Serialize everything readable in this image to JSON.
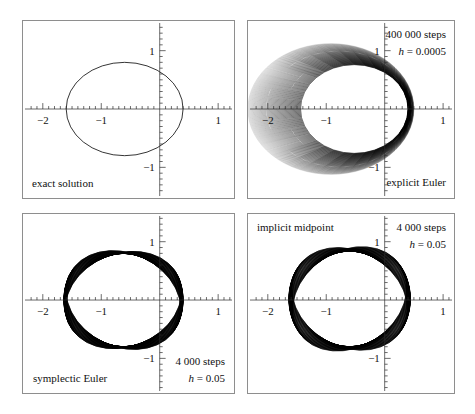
{
  "figure": {
    "background_color": "#ffffff",
    "frame_color": "#8e8e8e",
    "curve_color": "#000000"
  },
  "axes": {
    "x_label_values": [
      "-2",
      "-1",
      "1"
    ],
    "y_label_values": [
      "1",
      "-1"
    ],
    "x_range": [
      -2.45,
      1.45
    ],
    "y_range": [
      -1.52,
      1.52
    ],
    "x_major_ticks": [
      -2,
      -1,
      0,
      1
    ],
    "y_major_ticks": [
      -1,
      1
    ],
    "minor_tick_step": 0.1,
    "units_per_pixel": 0.016949,
    "pixels_per_unit": 59,
    "grid": false
  },
  "panels": [
    {
      "id": "exact",
      "method_label": "exact solution",
      "method_label_position": "bottom-left",
      "steps_label": "",
      "stepsize_label": "",
      "n_curves": 1,
      "description": "single exact Kepler ellipse, eccentricity 0.6"
    },
    {
      "id": "explicit",
      "method_label": "explicit Euler",
      "method_label_position": "bottom-right",
      "steps_label": "400 000 steps",
      "stepsize_label": "h = 0.0005",
      "stepsize_symbol": "h",
      "stepsize_value": "0.0005",
      "steps_count": "400 000",
      "n_curves": 60,
      "description": "outward spiralling family of ellipses, energy grows"
    },
    {
      "id": "symplectic",
      "method_label": "symplectic Euler",
      "method_label_position": "bottom-left",
      "steps_label": "4 000 steps",
      "stepsize_label": "h = 0.05",
      "stepsize_symbol": "h",
      "stepsize_value": "0.05",
      "steps_count": "4 000",
      "n_curves": 60,
      "description": "slowly precessing closed band, energy bounded"
    },
    {
      "id": "midpoint",
      "method_label": "implicit midpoint",
      "method_label_position": "top-left",
      "steps_label": "4 000 steps",
      "stepsize_label": "h = 0.05",
      "stepsize_symbol": "h",
      "stepsize_value": "0.05",
      "steps_count": "4 000",
      "n_curves": 60,
      "description": "precessing band of ellipses, energy bounded"
    }
  ],
  "chart_data": {
    "type": "line",
    "xlabel": "",
    "ylabel": "",
    "xlim": [
      -2.45,
      1.45
    ],
    "ylim": [
      -1.52,
      1.52
    ],
    "grid": false,
    "legend_position": "in-panel-annotations",
    "subplots": [
      {
        "panel": "exact",
        "annotations": [
          "exact solution"
        ],
        "series": [
          {
            "name": "exact ellipse",
            "shape": "ellipse",
            "center": [
              -0.6,
              0.0
            ],
            "semi_major": 1.0,
            "semi_minor": 0.8,
            "eccentricity": 0.6,
            "rotation_deg": 0,
            "stroke": "#000000",
            "stroke_width": 0.8
          }
        ]
      },
      {
        "panel": "explicit",
        "annotations": [
          "400 000 steps",
          "h = 0.0005",
          "explicit Euler"
        ],
        "series": [
          {
            "name": "explicit Euler family",
            "shape": "ellipse-family",
            "count": 60,
            "center_start": [
              -0.52,
              0.0
            ],
            "center_end": [
              -0.92,
              0.0
            ],
            "semi_major_start": 0.92,
            "semi_major_end": 1.42,
            "semi_minor_start": 0.76,
            "semi_minor_end": 1.12,
            "rotation_start_deg": 0,
            "rotation_end_deg": 0,
            "opacity_start": 1.0,
            "opacity_end": 0.22,
            "stroke": "#000000"
          }
        ]
      },
      {
        "panel": "symplectic",
        "annotations": [
          "4 000 steps",
          "h = 0.05",
          "symplectic Euler"
        ],
        "series": [
          {
            "name": "symplectic Euler family",
            "shape": "ellipse-family",
            "count": 60,
            "center_start": [
              -0.62,
              0.0
            ],
            "center_end": [
              -0.62,
              0.0
            ],
            "semi_major_start": 1.02,
            "semi_major_end": 1.02,
            "semi_minor_start": 0.8,
            "semi_minor_end": 0.8,
            "rotation_start_deg": -22,
            "rotation_end_deg": 26,
            "opacity_start": 0.95,
            "opacity_end": 0.95,
            "stroke": "#000000"
          }
        ]
      },
      {
        "panel": "midpoint",
        "annotations": [
          "implicit midpoint",
          "4 000 steps",
          "h = 0.05"
        ],
        "series": [
          {
            "name": "implicit midpoint family",
            "shape": "ellipse-family",
            "count": 60,
            "center_start": [
              -0.6,
              0.02
            ],
            "center_end": [
              -0.6,
              0.02
            ],
            "semi_major_start": 1.04,
            "semi_major_end": 1.04,
            "semi_minor_start": 0.82,
            "semi_minor_end": 0.82,
            "rotation_start_deg": -34,
            "rotation_end_deg": 30,
            "opacity_start": 0.9,
            "opacity_end": 0.9,
            "stroke": "#000000"
          }
        ]
      }
    ]
  }
}
